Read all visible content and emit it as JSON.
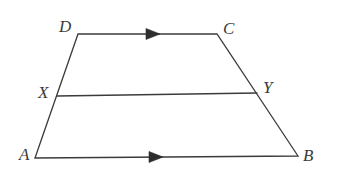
{
  "figure": {
    "width": 337,
    "height": 178,
    "background_color": "#ffffff",
    "stroke_color": "#3b3b3b",
    "label_color": "#3b3b3b",
    "stroke_width": 1.3
  },
  "points": {
    "A": {
      "label": "A",
      "x": 35,
      "y": 158,
      "label_x": 19,
      "label_y": 146
    },
    "B": {
      "label": "B",
      "x": 298,
      "y": 156,
      "label_x": 303,
      "label_y": 147
    },
    "C": {
      "label": "C",
      "x": 217,
      "y": 34,
      "label_x": 223,
      "label_y": 20
    },
    "D": {
      "label": "D",
      "x": 78,
      "y": 34,
      "label_x": 59,
      "label_y": 18
    },
    "X": {
      "label": "X",
      "x": 57,
      "y": 96,
      "label_x": 38,
      "label_y": 84
    },
    "Y": {
      "label": "Y",
      "x": 257,
      "y": 93,
      "label_x": 263,
      "label_y": 79
    }
  },
  "segments": [
    {
      "name": "segment-DC",
      "from": "D",
      "to": "C",
      "has_arrow": true,
      "arrow_marks": 1,
      "arrow_x": 152,
      "arrow_y": 34
    },
    {
      "name": "segment-AB",
      "from": "A",
      "to": "B",
      "has_arrow": true,
      "arrow_marks": 1,
      "arrow_x": 155,
      "arrow_y": 157
    },
    {
      "name": "segment-AD",
      "from": "A",
      "to": "D",
      "has_arrow": false
    },
    {
      "name": "segment-BC",
      "from": "B",
      "to": "C",
      "has_arrow": false
    },
    {
      "name": "segment-XY",
      "from": "X",
      "to": "Y",
      "has_arrow": false
    }
  ],
  "paths": {
    "outline": "M 35 158 L 78 34 L 217 34 L 298 156 Z",
    "midsegment": "M 57 96 L 257 93",
    "arrow_top": "M 146 28.5 L 160 34 L 146 39.5 Z",
    "arrow_bottom": "M 149 151.5 L 163 157 L 149 162.5 Z"
  },
  "annotations": {
    "parallel_pair": "DC parallel to AB",
    "arrow_count_top": 1,
    "arrow_count_bottom": 1
  }
}
